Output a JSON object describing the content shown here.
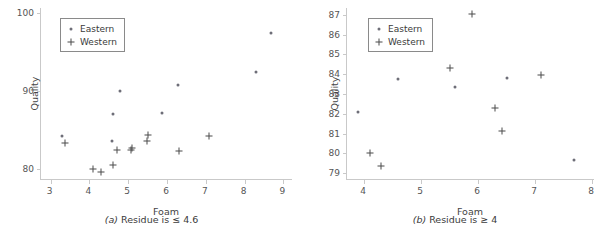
{
  "figure": {
    "legend": {
      "eastern_label": "Eastern",
      "western_label": "Western",
      "eastern_marker": "dot-marker-icon",
      "western_marker": "plus-marker-icon"
    },
    "colors": {
      "eastern": "#6e6e78",
      "western": "#4a4a4a",
      "axis": "#c9c9c9",
      "text": "#3a3a3a"
    }
  },
  "chart_data": [
    {
      "type": "scatter",
      "panel": "a",
      "caption_letter": "(a)",
      "caption_text": "Residue is ≤ 4.6",
      "title": "",
      "xlabel": "Foam",
      "ylabel": "Quality",
      "xlim": [
        2.75,
        9.25
      ],
      "ylim": [
        78.6,
        100.6
      ],
      "xticks": [
        3,
        4,
        5,
        6,
        7,
        8,
        9
      ],
      "yticks": [
        80,
        90,
        100
      ],
      "grid": false,
      "legend_position": "upper left",
      "series": [
        {
          "name": "Eastern",
          "marker": "dot",
          "points": [
            [
              3.28,
              84.2
            ],
            [
              4.58,
              83.6
            ],
            [
              4.62,
              87.0
            ],
            [
              4.78,
              90.0
            ],
            [
              5.88,
              87.2
            ],
            [
              6.28,
              90.7
            ],
            [
              8.3,
              92.4
            ],
            [
              8.68,
              97.4
            ]
          ]
        },
        {
          "name": "Western",
          "marker": "plus",
          "points": [
            [
              3.38,
              83.3
            ],
            [
              4.1,
              80.0
            ],
            [
              4.3,
              79.6
            ],
            [
              4.62,
              80.5
            ],
            [
              4.72,
              82.5
            ],
            [
              5.08,
              82.4
            ],
            [
              5.1,
              82.7
            ],
            [
              5.48,
              83.6
            ],
            [
              5.5,
              84.3
            ],
            [
              6.3,
              82.3
            ],
            [
              7.08,
              84.2
            ]
          ]
        }
      ]
    },
    {
      "type": "scatter",
      "panel": "b",
      "caption_letter": "(b)",
      "caption_text": "Residue is ≥ 4",
      "title": "",
      "xlabel": "Foam",
      "ylabel": "Quality",
      "xlim": [
        3.7,
        8.05
      ],
      "ylim": [
        78.65,
        87.35
      ],
      "xticks": [
        4,
        5,
        6,
        7,
        8
      ],
      "yticks": [
        79,
        80,
        81,
        82,
        83,
        84,
        85,
        86,
        87
      ],
      "grid": false,
      "legend_position": "upper left",
      "series": [
        {
          "name": "Eastern",
          "marker": "dot",
          "points": [
            [
              3.9,
              82.1
            ],
            [
              4.6,
              83.75
            ],
            [
              5.6,
              83.35
            ],
            [
              6.5,
              83.8
            ],
            [
              7.68,
              79.68
            ]
          ]
        },
        {
          "name": "Western",
          "marker": "plus",
          "points": [
            [
              4.1,
              80.0
            ],
            [
              4.3,
              79.38
            ],
            [
              5.5,
              84.3
            ],
            [
              5.9,
              87.05
            ],
            [
              6.3,
              82.3
            ],
            [
              6.42,
              81.15
            ],
            [
              7.1,
              83.95
            ]
          ]
        }
      ]
    }
  ]
}
